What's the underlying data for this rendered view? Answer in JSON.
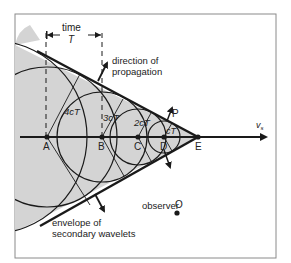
{
  "figure": {
    "time_label": "time",
    "time_symbol": "T",
    "direction_label_line1": "direction of",
    "direction_label_line2": "propagation",
    "point_labels": [
      "A",
      "B",
      "C",
      "D",
      "E"
    ],
    "radius_labels": [
      "4cT",
      "3cT",
      "2cT",
      "cT"
    ],
    "p_label": "P",
    "velocity_label": "v",
    "velocity_subscript": "s",
    "observer_label": "observer",
    "observer_symbol": "O",
    "envelope_label_line1": "envelope of",
    "envelope_label_line2": "secondary wavelets"
  },
  "colors": {
    "shade": "#d4d4d4",
    "ink": "#1a1a1a",
    "frame": "#8a8a8a"
  }
}
